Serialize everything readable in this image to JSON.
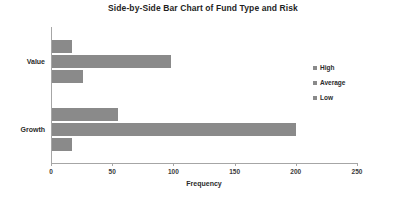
{
  "chart_data": {
    "type": "bar",
    "orientation": "horizontal",
    "title": "Side-by-Side Bar Chart of Fund Type and Risk",
    "xlabel": "Frequency",
    "ylabel": "",
    "categories": [
      "Value",
      "Growth"
    ],
    "series": [
      {
        "name": "High",
        "values": [
          16,
          54
        ],
        "color": "#8a8a8a"
      },
      {
        "name": "Average",
        "values": [
          97,
          199
        ],
        "color": "#8a8a8a"
      },
      {
        "name": "Low",
        "values": [
          25,
          16
        ],
        "color": "#8a8a8a"
      }
    ],
    "xlim": [
      0,
      250
    ],
    "xticks": [
      0,
      50,
      100,
      150,
      200,
      250
    ],
    "xtick_labels": [
      "0",
      "50",
      "100",
      "150",
      "200",
      "250"
    ],
    "grid": false,
    "legend_position": "right",
    "legend_entries": [
      "High",
      "Average",
      "Low"
    ],
    "axis_color": "#a6a6a6",
    "background": "#ffffff"
  }
}
